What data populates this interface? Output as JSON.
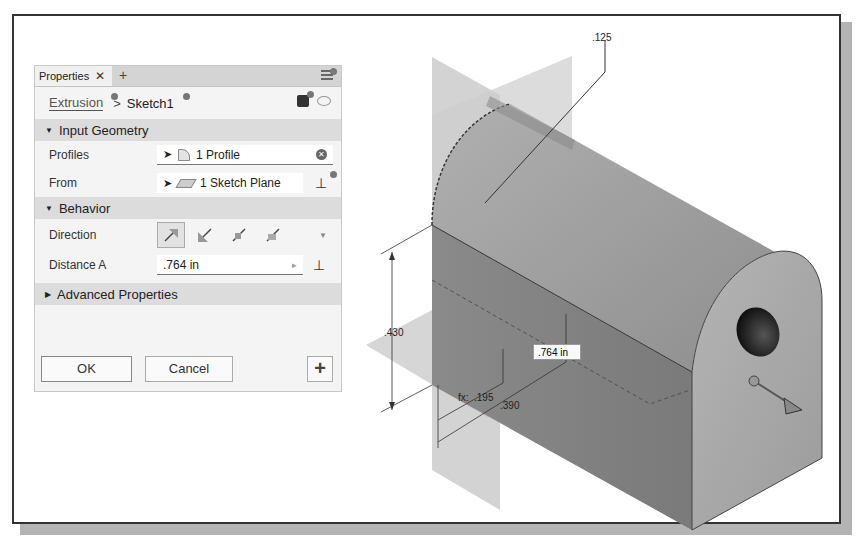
{
  "properties_panel": {
    "tab_label": "Properties",
    "tab_close": "✕",
    "tab_add": "+",
    "breadcrumb": {
      "parent": "Extrusion",
      "separator": ">",
      "current": "Sketch1"
    },
    "sections": {
      "input_geometry": {
        "label": "Input Geometry",
        "caret": "▼"
      },
      "behavior": {
        "label": "Behavior",
        "caret": "▼"
      },
      "advanced": {
        "label": "Advanced Properties",
        "caret": "▶"
      }
    },
    "fields": {
      "profiles": {
        "label": "Profiles",
        "value": "1 Profile",
        "clear": "✕"
      },
      "from": {
        "label": "From",
        "value": "1 Sketch Plane",
        "flip": "⊥"
      },
      "direction": {
        "label": "Direction",
        "options": [
          "default",
          "flipped",
          "symmetric",
          "asymmetric"
        ],
        "selected": "default",
        "more": "▼"
      },
      "distance_a": {
        "label": "Distance A",
        "value": ".764 in",
        "arrow": "▸",
        "flip": "⊥"
      }
    },
    "buttons": {
      "ok": "OK",
      "cancel": "Cancel",
      "plus": "+"
    }
  },
  "viewport": {
    "dimensions": {
      "radius": ".125",
      "height": ".430",
      "offset_a": ".195",
      "offset_b": ".390",
      "distance_edit": ".764 in",
      "fx_prefix": "fx:"
    },
    "colors": {
      "plane": "#c8c8c8",
      "solid_top": "#9a9a9a",
      "solid_side": "#8c8c8c",
      "solid_front": "#a6a6a6",
      "hole": "#2a2a2a"
    }
  }
}
